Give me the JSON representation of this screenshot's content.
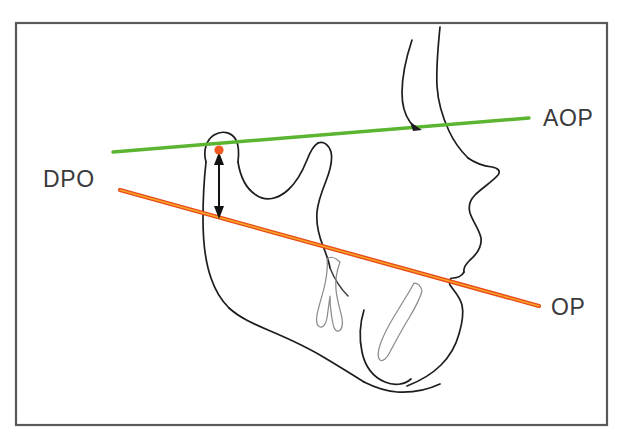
{
  "figure": {
    "background_color": "#ffffff",
    "frame": {
      "stroke_color": "#58585a",
      "x": 16,
      "y": 23,
      "width": 591,
      "height": 402
    }
  },
  "labels": {
    "aop": "AOP",
    "dpo": "DPO",
    "op": "OP"
  },
  "annotations": {
    "condyle_point": {
      "name": "condylion-point",
      "color": "#f05a22",
      "x": 219,
      "y": 150,
      "radius": 4.6
    },
    "dpo_measure": {
      "name": "dpo-vertical-distance",
      "color": "#131313",
      "x": 219,
      "y_top": 154,
      "y_bottom": 216,
      "double_headed": true
    },
    "profile_arrow": {
      "name": "profile-intersection-arrow",
      "color": "#1d1d1f",
      "x": 417,
      "y": 125
    }
  },
  "lines": {
    "aop": {
      "label": "AOP",
      "color": "#5cb531",
      "stroke_width": 3.4,
      "x1": 113,
      "y1": 152,
      "x2": 529,
      "y2": 118,
      "label_x": 543,
      "label_y": 126
    },
    "op": {
      "label": "OP",
      "color": "#e8491d",
      "core_color": "#f6a623",
      "stroke_width": 4.0,
      "x1": 120,
      "y1": 190,
      "x2": 539,
      "y2": 306,
      "label_x": 551,
      "label_y": 315
    },
    "dpo": {
      "label": "DPO",
      "label_x": 43,
      "label_y": 187
    }
  },
  "structures": [
    {
      "name": "facial-profile-forehead-nose",
      "type": "outline"
    },
    {
      "name": "nose-contour",
      "type": "outline"
    },
    {
      "name": "upper-lip-lower-lip-chin",
      "type": "outline"
    },
    {
      "name": "mandibular-condyle",
      "type": "outline"
    },
    {
      "name": "sigmoid-notch",
      "type": "outline"
    },
    {
      "name": "coronoid-process",
      "type": "outline"
    },
    {
      "name": "mandibular-ramus",
      "type": "outline"
    },
    {
      "name": "mandibular-body",
      "type": "outline"
    },
    {
      "name": "mandibular-symphysis",
      "type": "outline"
    },
    {
      "name": "lower-molar-tooth",
      "type": "tooth"
    },
    {
      "name": "lower-incisor-tooth",
      "type": "tooth"
    }
  ]
}
